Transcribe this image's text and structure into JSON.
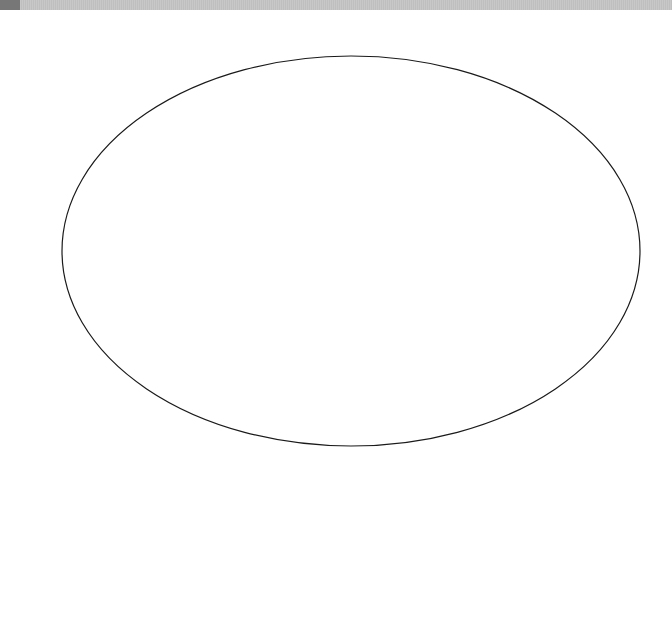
{
  "top_strip": {
    "color": "#c4c4c4",
    "block_color": "#777777"
  },
  "diagram": {
    "shapes": [
      {
        "type": "ellipse",
        "cx": 351,
        "cy": 251,
        "rx": 289,
        "ry": 195,
        "stroke": "#1a1a1a",
        "stroke_width": 1.2,
        "fill": "none"
      }
    ]
  }
}
